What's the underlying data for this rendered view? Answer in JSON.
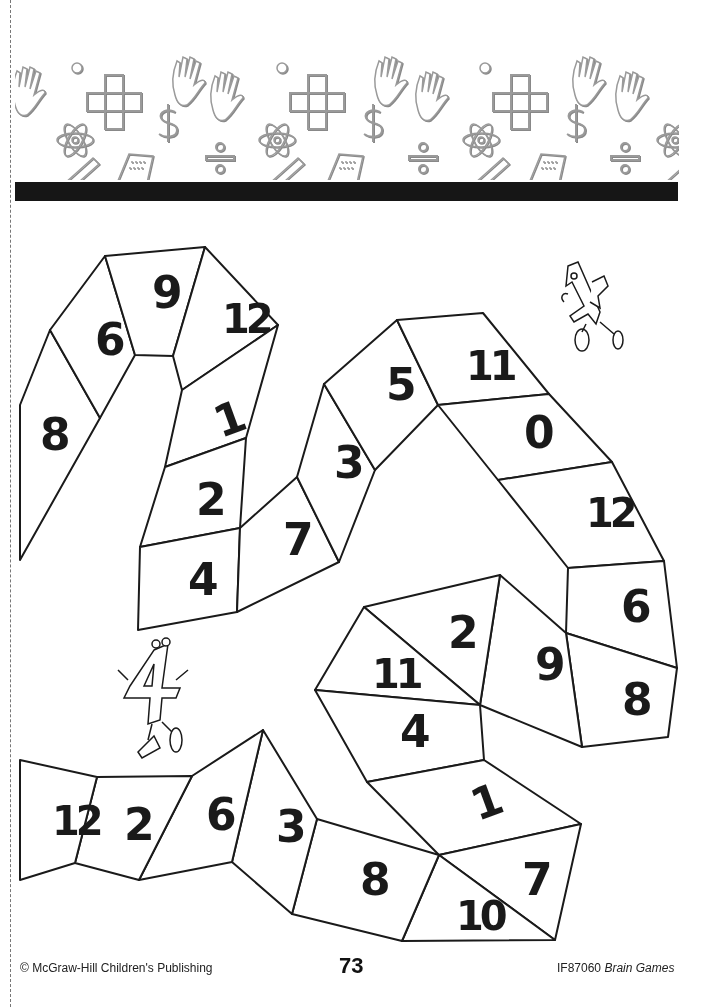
{
  "page": {
    "page_number": "73"
  },
  "banner": {
    "icons": [
      "hand-icon",
      "plus-grid-icon",
      "atom-icon",
      "dollar-icon",
      "division-icon",
      "calculator-icon",
      "pencil-icon",
      "ruler-icon",
      "thermometer-icon"
    ]
  },
  "puzzle": {
    "cells": [
      {
        "id": "c1",
        "value": "8",
        "points": "20,405 50,330 100,418 20,560",
        "label_x": 40,
        "label_y": 450,
        "rot": 0
      },
      {
        "id": "c2",
        "value": "6",
        "points": "50,330 105,256 135,355 100,418",
        "label_x": 95,
        "label_y": 355,
        "rot": 0
      },
      {
        "id": "c3",
        "value": "9",
        "points": "105,256 205,247 173,356 135,355",
        "label_x": 152,
        "label_y": 308,
        "rot": 0
      },
      {
        "id": "c4",
        "value": "12",
        "points": "205,247 278,325 182,390 173,356",
        "label_x": 222,
        "label_y": 333,
        "rot": 0
      },
      {
        "id": "c5",
        "value": "1",
        "points": "182,390 278,325 246,438 165,467",
        "label_x": 215,
        "label_y": 435,
        "rot": -20
      },
      {
        "id": "c6",
        "value": "2",
        "points": "165,467 246,438 240,528 140,547",
        "label_x": 196,
        "label_y": 515,
        "rot": 0
      },
      {
        "id": "c7",
        "value": "4",
        "points": "140,547 240,528 237,612 138,630",
        "label_x": 188,
        "label_y": 595,
        "rot": 0
      },
      {
        "id": "c8",
        "value": "7",
        "points": "240,528 297,477 339,562 237,612",
        "label_x": 283,
        "label_y": 555,
        "rot": 0
      },
      {
        "id": "c9",
        "value": "3",
        "points": "297,477 324,384 375,470 339,562",
        "label_x": 334,
        "label_y": 478,
        "rot": 0
      },
      {
        "id": "c10",
        "value": "5",
        "points": "324,384 397,320 438,405 375,470",
        "label_x": 386,
        "label_y": 400,
        "rot": 0
      },
      {
        "id": "c11",
        "value": "11",
        "points": "397,320 483,313 549,394 438,405",
        "label_x": 466,
        "label_y": 380,
        "rot": 0
      },
      {
        "id": "c12",
        "value": "0",
        "points": "438,405 549,394 612,462 498,480",
        "label_x": 524,
        "label_y": 448,
        "rot": 0
      },
      {
        "id": "c13",
        "value": "12",
        "points": "498,480 612,462 664,561 568,568",
        "label_x": 586,
        "label_y": 527,
        "rot": 0
      },
      {
        "id": "c14",
        "value": "6",
        "points": "568,568 664,561 677,668 566,633",
        "label_x": 621,
        "label_y": 622,
        "rot": 0
      },
      {
        "id": "c15",
        "value": "8",
        "points": "566,633 677,668 668,737 582,747",
        "label_x": 622,
        "label_y": 715,
        "rot": 0
      },
      {
        "id": "c16",
        "value": "9",
        "points": "500,575 566,633 582,747 480,705",
        "label_x": 535,
        "label_y": 680,
        "rot": 0
      },
      {
        "id": "c17",
        "value": "2",
        "points": "364,607 500,575 480,705",
        "label_x": 448,
        "label_y": 648,
        "rot": 0
      },
      {
        "id": "c18",
        "value": "11",
        "points": "364,607 480,705 315,690",
        "label_x": 372,
        "label_y": 688,
        "rot": 0
      },
      {
        "id": "c19",
        "value": "4",
        "points": "315,690 480,705 484,760 367,782",
        "label_x": 400,
        "label_y": 747,
        "rot": 0
      },
      {
        "id": "c20",
        "value": "1",
        "points": "367,782 484,760 581,824 439,855",
        "label_x": 472,
        "label_y": 818,
        "rot": -20
      },
      {
        "id": "c21",
        "value": "7",
        "points": "439,855 581,824 555,940",
        "label_x": 522,
        "label_y": 895,
        "rot": 0
      },
      {
        "id": "c22",
        "value": "10",
        "points": "439,855 555,940 402,941",
        "label_x": 456,
        "label_y": 930,
        "rot": 0
      },
      {
        "id": "c23",
        "value": "8",
        "points": "317,819 439,855 402,941 292,914",
        "label_x": 360,
        "label_y": 895,
        "rot": 0
      },
      {
        "id": "c24",
        "value": "3",
        "points": "263,730 317,819 292,914 232,862",
        "label_x": 276,
        "label_y": 842,
        "rot": 0
      },
      {
        "id": "c25",
        "value": "6",
        "points": "192,776 263,730 232,862 139,880",
        "label_x": 206,
        "label_y": 830,
        "rot": 0
      },
      {
        "id": "c26",
        "value": "2",
        "points": "97,777 192,776 139,880 75,863",
        "label_x": 124,
        "label_y": 840,
        "rot": 0
      },
      {
        "id": "c27",
        "value": "12",
        "points": "20,760 97,777 75,863 20,880",
        "label_x": 52,
        "label_y": 835,
        "rot": 0
      }
    ],
    "characters": [
      {
        "name": "number-one-character",
        "x": 560,
        "y": 262
      },
      {
        "name": "number-four-character",
        "x": 118,
        "y": 640
      }
    ]
  },
  "footer": {
    "copyright": "© McGraw-Hill Children's Publishing",
    "page_number": "73",
    "code": "IF87060",
    "book_title": "Brain Games"
  },
  "colors": {
    "ink": "#1a1a1a",
    "paper": "#ffffff",
    "banner_bar": "#161616",
    "emboss": "#9a9a9a"
  }
}
